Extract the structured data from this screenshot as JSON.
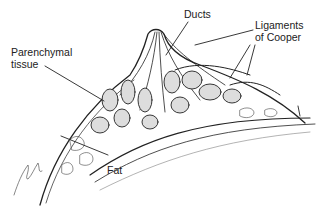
{
  "diagram": {
    "labels": {
      "ducts": "Ducts",
      "ligaments_line1": "Ligaments",
      "ligaments_line2": "of Cooper",
      "parenchymal_line1": "Parenchymal",
      "parenchymal_line2": "tissue",
      "fat": "Fat"
    },
    "signature": "Glenn"
  }
}
